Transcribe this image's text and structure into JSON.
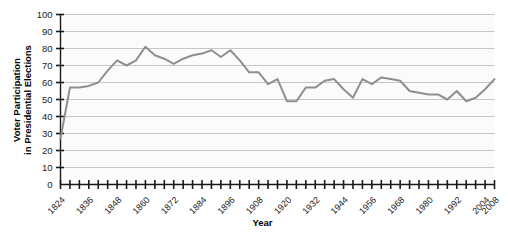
{
  "chart_data": {
    "type": "line",
    "title": "",
    "xlabel": "Year",
    "ylabel": "Voter Participation in Presidential Elections",
    "ylabel_line1": "Voter Participation",
    "ylabel_line2": "in Presidential Elections",
    "ylim": [
      0,
      100
    ],
    "yticks": [
      0,
      10,
      20,
      30,
      40,
      50,
      60,
      70,
      80,
      90,
      100
    ],
    "grid": true,
    "legend": "none",
    "xlim": [
      1824,
      2008
    ],
    "xtick_labels": [
      "1824",
      "1836",
      "1848",
      "1860",
      "1872",
      "1884",
      "1896",
      "1908",
      "1920",
      "1932",
      "1944",
      "1956",
      "1968",
      "1980",
      "1992",
      "2004",
      "2008"
    ],
    "x": [
      1824,
      1828,
      1832,
      1836,
      1840,
      1844,
      1848,
      1852,
      1856,
      1860,
      1864,
      1868,
      1872,
      1876,
      1880,
      1884,
      1888,
      1892,
      1896,
      1900,
      1904,
      1908,
      1912,
      1916,
      1920,
      1924,
      1928,
      1932,
      1936,
      1940,
      1944,
      1948,
      1952,
      1956,
      1960,
      1964,
      1968,
      1972,
      1976,
      1980,
      1984,
      1988,
      1992,
      1996,
      2000,
      2004,
      2008
    ],
    "values": [
      27,
      57,
      57,
      58,
      60,
      67,
      73,
      70,
      73,
      81,
      76,
      74,
      71,
      74,
      76,
      77,
      79,
      75,
      79,
      73,
      66,
      66,
      59,
      62,
      49,
      49,
      57,
      57,
      61,
      62,
      56,
      51,
      62,
      59,
      63,
      62,
      61,
      55,
      54,
      53,
      53,
      50,
      55,
      49,
      51,
      56,
      62
    ],
    "series": [
      {
        "name": "Voter Participation",
        "values": [
          27,
          57,
          57,
          58,
          60,
          67,
          73,
          70,
          73,
          81,
          76,
          74,
          71,
          74,
          76,
          77,
          79,
          75,
          79,
          73,
          66,
          66,
          59,
          62,
          49,
          49,
          57,
          57,
          61,
          62,
          56,
          51,
          62,
          59,
          63,
          62,
          61,
          55,
          54,
          53,
          53,
          50,
          55,
          49,
          51,
          56,
          62
        ]
      }
    ],
    "line_color": "#8f8f8f",
    "grid_color": "#b9b9b9",
    "axis_color": "#1a1a1a"
  }
}
